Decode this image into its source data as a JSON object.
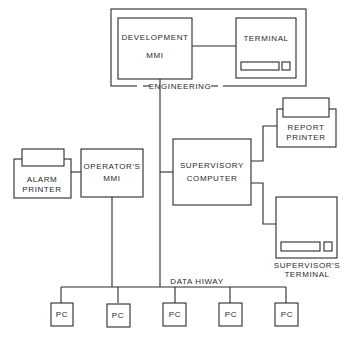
{
  "diagram": {
    "type": "block-diagram",
    "groups": [
      {
        "id": "engineering",
        "label": "ENGINEERING"
      }
    ],
    "nodes": [
      {
        "id": "dev_mmi",
        "lines": [
          "DEVELOPMENT",
          "MMI"
        ],
        "group": "engineering"
      },
      {
        "id": "eng_terminal",
        "lines": [
          "TERMINAL"
        ],
        "group": "engineering"
      },
      {
        "id": "alarm_printer",
        "lines": [
          "ALARM",
          "PRINTER"
        ]
      },
      {
        "id": "operators_mmi",
        "lines": [
          "OPERATOR'S",
          "MMI"
        ]
      },
      {
        "id": "supervisory_computer",
        "lines": [
          "SUPERVISORY",
          "COMPUTER"
        ]
      },
      {
        "id": "report_printer",
        "lines": [
          "REPORT",
          "PRINTER"
        ]
      },
      {
        "id": "supervisors_terminal",
        "lines": [
          "SUPERVISOR'S",
          "TERMINAL"
        ]
      },
      {
        "id": "pc1",
        "lines": [
          "PC"
        ]
      },
      {
        "id": "pc2",
        "lines": [
          "PC"
        ]
      },
      {
        "id": "pc3",
        "lines": [
          "PC"
        ]
      },
      {
        "id": "pc4",
        "lines": [
          "PC"
        ]
      },
      {
        "id": "pc5",
        "lines": [
          "PC"
        ]
      }
    ],
    "bus": {
      "label": "DATA HIWAY"
    },
    "edges": [
      [
        "dev_mmi",
        "eng_terminal"
      ],
      [
        "alarm_printer",
        "operators_mmi"
      ],
      [
        "supervisory_computer",
        "report_printer"
      ],
      [
        "supervisory_computer",
        "supervisors_terminal"
      ],
      [
        "dev_mmi",
        "bus"
      ],
      [
        "supervisory_computer",
        "bus"
      ],
      [
        "operators_mmi",
        "bus"
      ],
      [
        "bus",
        "pc1"
      ],
      [
        "bus",
        "pc2"
      ],
      [
        "bus",
        "pc3"
      ],
      [
        "bus",
        "pc4"
      ],
      [
        "bus",
        "pc5"
      ]
    ]
  }
}
